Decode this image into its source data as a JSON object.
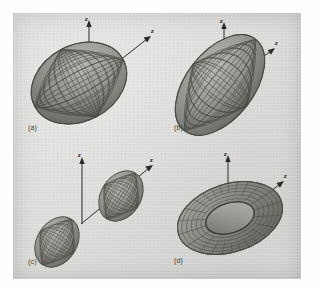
{
  "figure": {
    "background_color": "#fefefe",
    "panel_color": "#dcdcda",
    "ink_color": "#24231f",
    "surface_fill": "#8d8d88",
    "surface_mesh": "#3c3c38"
  },
  "panels": [
    {
      "id": "a",
      "caption": "(a)",
      "shape": "ellipsoid",
      "axes": [
        {
          "name": "z-axis",
          "label": "z",
          "direction": "up"
        },
        {
          "name": "second-axis",
          "label": "z",
          "direction": "up-right"
        }
      ]
    },
    {
      "id": "b",
      "caption": "(b)",
      "shape": "ellipsoid",
      "axes": [
        {
          "name": "z-axis",
          "label": "z",
          "direction": "up"
        },
        {
          "name": "second-axis",
          "label": "z",
          "direction": "up-right"
        }
      ]
    },
    {
      "id": "c",
      "caption": "(c)",
      "shape": "two-sheeted-hyperboloid",
      "axes": [
        {
          "name": "z-axis",
          "label": "z",
          "direction": "up"
        },
        {
          "name": "second-axis",
          "label": "z",
          "direction": "up-right"
        }
      ]
    },
    {
      "id": "d",
      "caption": "(d)",
      "shape": "torus",
      "axes": [
        {
          "name": "z-axis",
          "label": "z",
          "direction": "up"
        },
        {
          "name": "second-axis",
          "label": "z",
          "direction": "up-right"
        }
      ]
    }
  ]
}
